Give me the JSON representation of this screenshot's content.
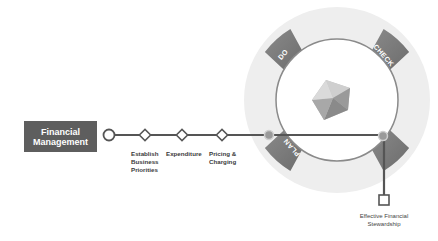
{
  "start_box": {
    "line1": "Financial",
    "line2": "Management"
  },
  "steps": [
    {
      "label": "Establish\nBusiness\nPriorities"
    },
    {
      "label": "Expenditure"
    },
    {
      "label": "Pricing &\nCharging"
    }
  ],
  "cycle": {
    "segments": [
      {
        "label": "DO"
      },
      {
        "label": "CHECK"
      },
      {
        "label": "ACT"
      },
      {
        "label": "PLAN"
      }
    ]
  },
  "outcome": {
    "label": "Effective Financial\nStewardship"
  },
  "colors": {
    "ring_light": "#eeeeee",
    "segment_dark": "#7a7a7a",
    "line": "#555555",
    "box": "#5e5e5e",
    "node": "#9a9a9a"
  }
}
